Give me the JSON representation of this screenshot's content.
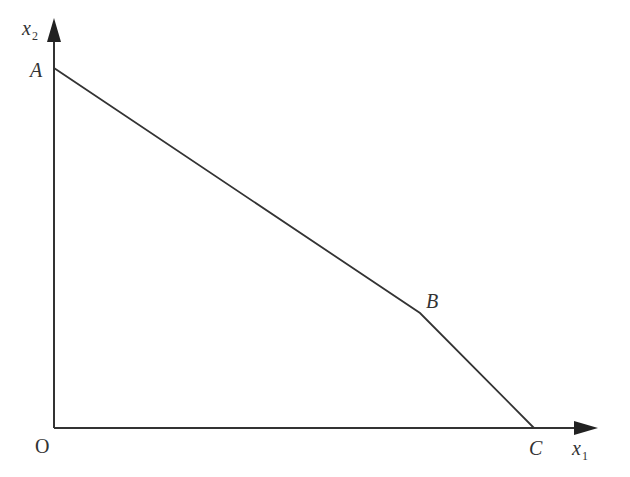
{
  "diagram": {
    "type": "piecewise-linear-frontier",
    "axes": {
      "x": {
        "var": "x",
        "sub": "1"
      },
      "y": {
        "var": "x",
        "sub": "2"
      },
      "origin_label": "O"
    },
    "points": [
      {
        "label": "A",
        "px": [
          54,
          68
        ]
      },
      {
        "label": "B",
        "px": [
          420,
          313
        ]
      },
      {
        "label": "C",
        "px": [
          534,
          428
        ]
      }
    ],
    "colors": {
      "line": "#333333",
      "background": "#ffffff"
    }
  }
}
